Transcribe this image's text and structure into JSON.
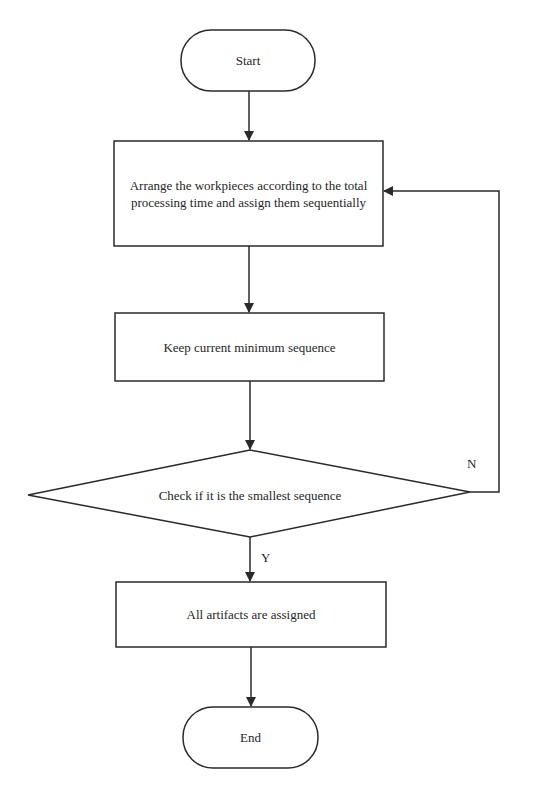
{
  "diagram": {
    "type": "flowchart",
    "line_color": "#2a2a2a",
    "background": "#ffffff",
    "nodes": {
      "start": {
        "shape": "terminator",
        "label": "Start"
      },
      "arrange": {
        "shape": "process",
        "label": "Arrange the workpieces according to the total processing time and assign them sequentially"
      },
      "keep": {
        "shape": "process",
        "label": "Keep current minimum sequence"
      },
      "check": {
        "shape": "decision",
        "label": "Check if it is the smallest sequence"
      },
      "assigned": {
        "shape": "process",
        "label": "All artifacts are assigned"
      },
      "end": {
        "shape": "terminator",
        "label": "End"
      }
    },
    "edges": [
      {
        "from": "start",
        "to": "arrange",
        "label": ""
      },
      {
        "from": "arrange",
        "to": "keep",
        "label": ""
      },
      {
        "from": "keep",
        "to": "check",
        "label": ""
      },
      {
        "from": "check",
        "to": "arrange",
        "label": "N"
      },
      {
        "from": "check",
        "to": "assigned",
        "label": "Y"
      },
      {
        "from": "assigned",
        "to": "end",
        "label": ""
      }
    ],
    "edge_labels": {
      "no": "N",
      "yes": "Y"
    }
  }
}
